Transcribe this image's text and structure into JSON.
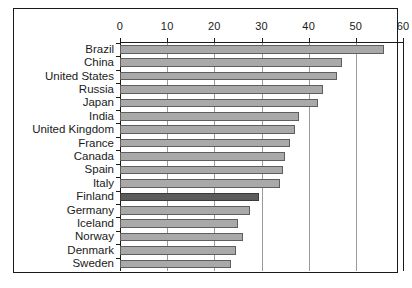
{
  "chart_data": {
    "type": "bar",
    "orientation": "horizontal",
    "title": "",
    "subtitle": "",
    "xlabel": "",
    "ylabel": "",
    "xlim": [
      0,
      60
    ],
    "ylim": null,
    "grid": true,
    "legend": null,
    "xticks": [
      0,
      10,
      20,
      30,
      40,
      50,
      60
    ],
    "xtick_labels": [
      "0",
      "10",
      "20",
      "30",
      "40",
      "50",
      "60"
    ],
    "categories": [
      "Brazil",
      "China",
      "United States",
      "Russia",
      "Japan",
      "India",
      "United Kingdom",
      "France",
      "Canada",
      "Spain",
      "Italy",
      "Finland",
      "Germany",
      "Iceland",
      "Norway",
      "Denmark",
      "Sweden"
    ],
    "values": [
      56,
      47,
      46,
      43,
      42,
      38,
      37,
      36,
      35,
      34.5,
      34,
      29.5,
      27.5,
      25,
      26,
      24.5,
      23.5
    ],
    "highlight_category": "Finland",
    "colors": {
      "bar_fill": "#a9a9a9",
      "bar_edge": "#5e5e5e",
      "highlight_fill": "#5c5c5c",
      "highlight_edge": "#3a3a3a",
      "gridline": "#9a9a9a",
      "axis": "#1a1a1a",
      "frame": "#1a1a1a",
      "background": "#ffffff",
      "text": "#1a1a1a"
    }
  }
}
